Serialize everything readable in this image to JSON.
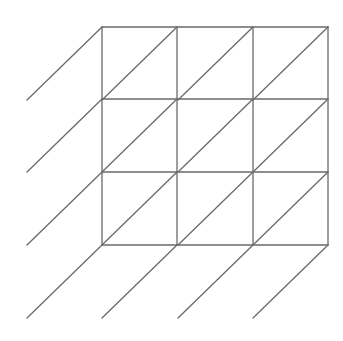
{
  "diagram": {
    "type": "lattice-grid-with-diagonals",
    "grid": {
      "rows": 3,
      "cols": 3,
      "x_lines": [
        102,
        177,
        253,
        328
      ],
      "y_lines": [
        27,
        99,
        172,
        245
      ]
    },
    "diagonal_offset": {
      "dx": -75,
      "dy": 73
    },
    "colors": {
      "line": "#6a6a6a",
      "background": "#ffffff"
    }
  }
}
